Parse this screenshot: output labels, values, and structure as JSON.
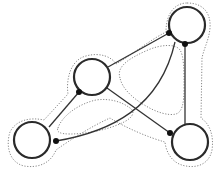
{
  "diagram": {
    "type": "graph",
    "nodes": [
      {
        "id": "top-right",
        "cx": 187,
        "cy": 25,
        "r": 18
      },
      {
        "id": "middle",
        "cx": 92,
        "cy": 77,
        "r": 18
      },
      {
        "id": "bottom-left",
        "cx": 32,
        "cy": 140,
        "r": 18
      },
      {
        "id": "bottom-right",
        "cx": 190,
        "cy": 142,
        "r": 18
      }
    ],
    "ports": [
      {
        "node": "top-right",
        "x": 169,
        "y": 33
      },
      {
        "node": "top-right",
        "x": 185,
        "y": 44
      },
      {
        "node": "middle",
        "x": 79,
        "y": 92
      },
      {
        "node": "bottom-left",
        "x": 56,
        "y": 141
      },
      {
        "node": "bottom-right",
        "x": 170,
        "y": 133
      }
    ],
    "edges": [
      {
        "from": "middle",
        "to": "top-right"
      },
      {
        "from": "middle",
        "to": "bottom-left"
      },
      {
        "from": "middle",
        "to": "bottom-right"
      },
      {
        "from": "bottom-left",
        "to": "top-right",
        "curved": true
      },
      {
        "from": "top-right",
        "to": "bottom-right"
      }
    ],
    "colors": {
      "node_stroke": "#2a2a2a",
      "edge": "#333333",
      "envelope": "#888888",
      "port": "#111111",
      "background": "#ffffff"
    }
  }
}
